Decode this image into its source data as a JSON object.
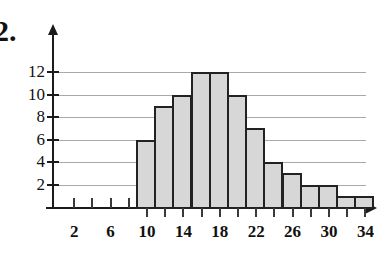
{
  "problem": {
    "number": "2."
  },
  "top_edge_text": {
    "fragment": ""
  },
  "chart_data": {
    "type": "bar",
    "title": "",
    "subtitle": "",
    "xlabel": "",
    "ylabel": "",
    "xlim": [
      0,
      36
    ],
    "ylim": [
      0,
      13
    ],
    "grid": true,
    "legend": null,
    "bar_interval_width": 2,
    "categories": [
      "9-11",
      "11-13",
      "13-15",
      "15-17",
      "17-19",
      "19-21",
      "21-23",
      "23-25",
      "25-27",
      "27-29",
      "29-31",
      "31-33",
      "33-35"
    ],
    "bin_edges": [
      9,
      11,
      13,
      15,
      17,
      19,
      21,
      23,
      25,
      27,
      29,
      31,
      33,
      35
    ],
    "values": [
      6,
      9,
      10,
      12,
      12,
      10,
      7,
      4,
      3,
      2,
      2,
      1,
      1
    ],
    "x_ticks": [
      2,
      4,
      6,
      8,
      10,
      12,
      14,
      16,
      18,
      20,
      22,
      24,
      26,
      28,
      30,
      32,
      34
    ],
    "x_tick_labels": [
      "2",
      "",
      "6",
      "",
      "10",
      "",
      "14",
      "",
      "18",
      "",
      "22",
      "",
      "26",
      "",
      "30",
      "",
      "34"
    ],
    "y_ticks": [
      2,
      4,
      6,
      8,
      10,
      12
    ],
    "y_tick_labels": [
      "2",
      "4",
      "6",
      "8",
      "10",
      "12"
    ],
    "colors": {
      "bar_fill": "#d7d7d7",
      "bar_stroke": "#222222",
      "axis": "#1b1b1b",
      "gridline": "#a9a9a9",
      "text": "#111111",
      "background": "#ffffff"
    }
  }
}
